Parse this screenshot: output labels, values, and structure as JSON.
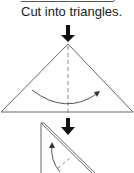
{
  "instruction": {
    "caption": "Cut into triangles."
  },
  "diagram": {
    "steps": [
      {
        "name": "previous-step-edge",
        "shape": "partial rectangle edge"
      },
      {
        "name": "down-arrow-1",
        "shape": "arrow"
      },
      {
        "name": "triangle-step",
        "shape": "triangle",
        "fold_line": "dashed vertical",
        "motion": "curved arrow left-to-right"
      },
      {
        "name": "down-arrow-2",
        "shape": "arrow"
      },
      {
        "name": "folded-triangle-step",
        "shape": "right triangle (folded layers)",
        "fold_line": "dashed diagonal",
        "motion": "curved arrow upward"
      }
    ],
    "colors": {
      "line": "#555555",
      "arrow_fill": "#111111",
      "text": "#222222",
      "background": "#ffffff"
    }
  }
}
